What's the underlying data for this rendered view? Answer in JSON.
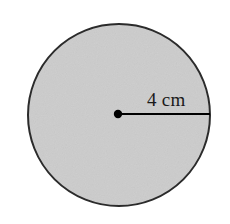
{
  "figure": {
    "kind": "geometry-diagram",
    "background_color": "#ffffff",
    "width": 230,
    "height": 224
  },
  "circle": {
    "name": "shaded-circle",
    "center_x": 119,
    "center_y": 115,
    "radius_px": 91,
    "fill_color": "#cccccc",
    "stroke_color": "#2b2b2b",
    "stroke_width": 2
  },
  "center_point": {
    "name": "center-dot",
    "x": 118,
    "y": 114,
    "radius_px": 4.2,
    "color": "#000000"
  },
  "radius_segment": {
    "name": "radius-line",
    "x1": 118,
    "y1": 114,
    "x2": 210,
    "y2": 114,
    "color": "#000000",
    "stroke_width": 2.2,
    "label": "4 cm",
    "label_value": 4,
    "label_unit": "cm",
    "label_x": 147,
    "label_y": 90
  }
}
